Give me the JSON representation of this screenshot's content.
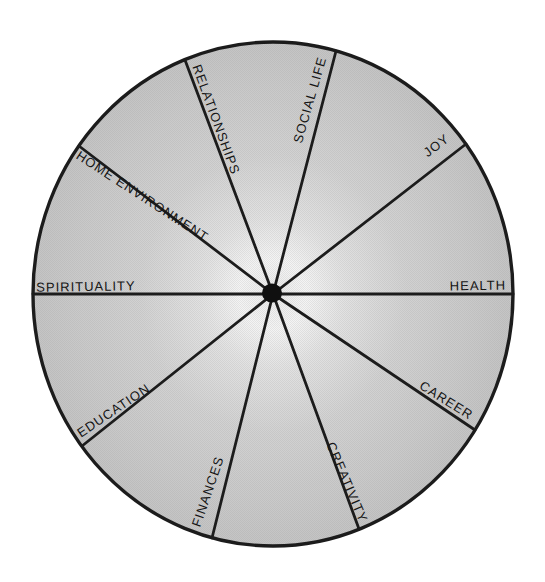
{
  "wheel": {
    "sectors": [
      {
        "label": "SOCIAL LIFE"
      },
      {
        "label": "JOY"
      },
      {
        "label": "HEALTH"
      },
      {
        "label": "CAREER"
      },
      {
        "label": "CREATIVITY"
      },
      {
        "label": "FINANCES"
      },
      {
        "label": "EDUCATION"
      },
      {
        "label": "SPIRITUALITY"
      },
      {
        "label": "HOME ENVIRONMENT"
      },
      {
        "label": "RELATIONSHIPS"
      }
    ],
    "sector_count": "10",
    "colors": {
      "outline": "#1c1c1c",
      "hub": "#101010",
      "fill_center": "#f2f2f2",
      "fill_mid": "#d9d9d9",
      "fill_edge": "#c5c5c5",
      "label_text": "#151515",
      "page_background": "#ffffff"
    }
  }
}
